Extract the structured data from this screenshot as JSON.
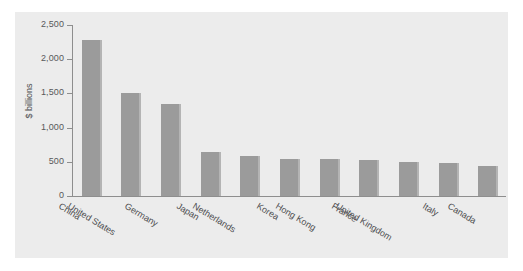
{
  "chart_data": {
    "type": "bar",
    "title": "",
    "subtitle": "",
    "xlabel": "",
    "ylabel": "$ billions",
    "ylim": [
      0,
      2500
    ],
    "ytick_values": [
      0,
      500,
      1000,
      1500,
      2000,
      2500
    ],
    "ytick_labels": [
      "0",
      "500",
      "1,000",
      "1,500",
      "2,000",
      "2,500"
    ],
    "grid": false,
    "legend": null,
    "categories": [
      "China",
      "United States",
      "Germany",
      "Japan",
      "Netherlands",
      "Korea",
      "Hong Kong",
      "France",
      "United Kingdom",
      "Italy",
      "Canada"
    ],
    "values": [
      2280,
      1510,
      1340,
      640,
      580,
      545,
      535,
      530,
      490,
      485,
      440
    ],
    "bar_color": "#9b9b9b",
    "bar_edge_color": "#b4b4b4",
    "panel_color": "#ececec",
    "axis_color": "#8e8e8e",
    "text_color": "#4e4e50"
  }
}
